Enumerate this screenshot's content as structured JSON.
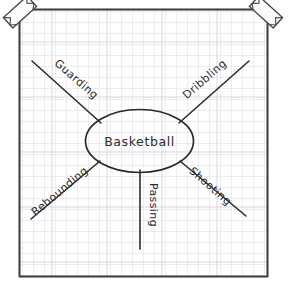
{
  "diagram": {
    "type": "mind-map",
    "medium": "hand-drawn on graph paper",
    "paper": {
      "background_color": "#ffffff",
      "grid_line_color": "#d9d9de",
      "grid_cell_px": 11,
      "border_color": "#3a3a3a"
    },
    "ink_color": "#2b2b2b",
    "center": {
      "label": "Basketball",
      "shape": "ellipse"
    },
    "branches": [
      {
        "label": "Guarding",
        "direction": "upper-left",
        "angle_deg": -45,
        "text_rotation_deg": 42
      },
      {
        "label": "Dribbling",
        "direction": "upper-right",
        "angle_deg": 45,
        "text_rotation_deg": -42
      },
      {
        "label": "Rebounding",
        "direction": "lower-left",
        "angle_deg": 45,
        "text_rotation_deg": -40
      },
      {
        "label": "Shooting",
        "direction": "lower-right",
        "angle_deg": -45,
        "text_rotation_deg": 42
      },
      {
        "label": "Passing",
        "direction": "down",
        "angle_deg": 90,
        "text_rotation_deg": 90
      }
    ],
    "tape_pieces": [
      {
        "position": "top-left-corner",
        "rotation_deg": -42
      },
      {
        "position": "top-right-corner",
        "rotation_deg": 42
      }
    ]
  }
}
